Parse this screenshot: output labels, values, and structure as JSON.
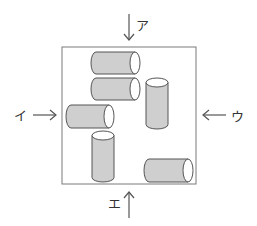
{
  "diagram": {
    "box": {
      "x": 62,
      "y": 47,
      "w": 134,
      "h": 137
    },
    "colors": {
      "cylinder_fill": "#cfcfcf",
      "outline": "#555555",
      "cap": "#ffffff",
      "box_stroke": "#7a7a7a"
    },
    "views": [
      {
        "id": "top",
        "label": "ア",
        "direction": "down"
      },
      {
        "id": "left",
        "label": "イ",
        "direction": "right"
      },
      {
        "id": "right",
        "label": "ウ",
        "direction": "left"
      },
      {
        "id": "bottom",
        "label": "エ",
        "direction": "up"
      }
    ],
    "cylinders": [
      {
        "orientation": "horizontal",
        "x": 91,
        "y": 52,
        "w": 49,
        "h": 22
      },
      {
        "orientation": "horizontal",
        "x": 91,
        "y": 78,
        "w": 49,
        "h": 22
      },
      {
        "orientation": "vertical",
        "x": 146,
        "y": 78,
        "w": 22,
        "h": 51
      },
      {
        "orientation": "horizontal",
        "x": 66,
        "y": 105,
        "w": 48,
        "h": 23
      },
      {
        "orientation": "vertical",
        "x": 92,
        "y": 131,
        "w": 22,
        "h": 51
      },
      {
        "orientation": "horizontal",
        "x": 144,
        "y": 159,
        "w": 49,
        "h": 23
      }
    ]
  }
}
